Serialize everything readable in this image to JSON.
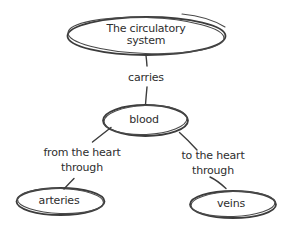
{
  "diagram": {
    "type": "concept-map",
    "background": "#ffffff",
    "ink_color": "#3c3c3c",
    "text_color": "#2e2e2e"
  },
  "nodes": [
    {
      "id": "circulatory-system",
      "label": "The circulatory\nsystem"
    },
    {
      "id": "blood",
      "label": "blood"
    },
    {
      "id": "arteries",
      "label": "arteries"
    },
    {
      "id": "veins",
      "label": "veins"
    }
  ],
  "edges": [
    {
      "from": "circulatory-system",
      "to": "blood",
      "label": "carries"
    },
    {
      "from": "blood",
      "to": "arteries",
      "label": "from the heart\nthrough"
    },
    {
      "from": "blood",
      "to": "veins",
      "label": "to the heart\nthrough"
    }
  ]
}
